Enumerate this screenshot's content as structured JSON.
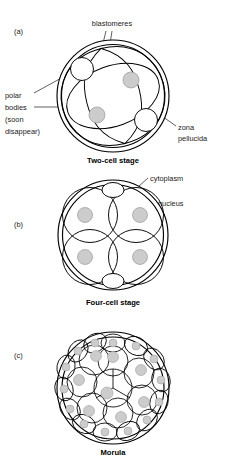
{
  "figure": {
    "style": "line-art-diagram",
    "colors": {
      "line": "#000000",
      "nucleus_fill": "#cccccc",
      "nucleus_stroke": "#9a9a9a",
      "background": "#ffffff",
      "text": "#1a1a1a"
    }
  },
  "panels": [
    {
      "tag": "(a)",
      "caption": "Two-cell stage",
      "labels": {
        "blastomeres": "blastomeres",
        "polar_bodies_line1": "polar",
        "polar_bodies_line2": "bodies",
        "polar_bodies_line3": "(soon",
        "polar_bodies_line4": "disappear)",
        "zona_line1": "zona",
        "zona_line2": "pellucida"
      },
      "counts": {
        "blastomeres": 2,
        "nuclei": 2,
        "polar_bodies": 2
      }
    },
    {
      "tag": "(b)",
      "caption": "Four-cell stage",
      "labels": {
        "cytoplasm": "cytoplasm",
        "nucleus": "nucleus"
      },
      "counts": {
        "blastomeres": 4,
        "nuclei": 4,
        "polar_bodies": 2
      }
    },
    {
      "tag": "(c)",
      "caption": "Morula",
      "labels": {},
      "counts": {
        "blastomeres": 25,
        "nuclei": 25,
        "polar_bodies": 0
      }
    }
  ]
}
